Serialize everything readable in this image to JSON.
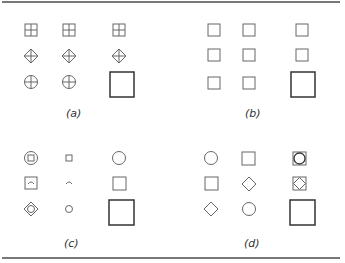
{
  "figure": {
    "panels": [
      {
        "id": "a",
        "label": "(a)",
        "description": "Grid of symbols: squares with cross, diamonds with cross, circles with cross; large square bottom-right"
      },
      {
        "id": "b",
        "label": "(b)",
        "description": "Grid of plain small squares; large square bottom-right"
      },
      {
        "id": "c",
        "label": "(c)",
        "description": "Mixed symbols: concentric circle-square, small square, circle; boxed arc, arc, square; diamond-circle, small circle, large square"
      },
      {
        "id": "d",
        "label": "(d)",
        "description": "Circle, square, circle-in-square; square, diamond, diamond-in-square; diamond, circle, large square"
      }
    ]
  },
  "colors": {
    "stroke": "#555555",
    "large_stroke": "#333333",
    "rule": "#777777"
  }
}
